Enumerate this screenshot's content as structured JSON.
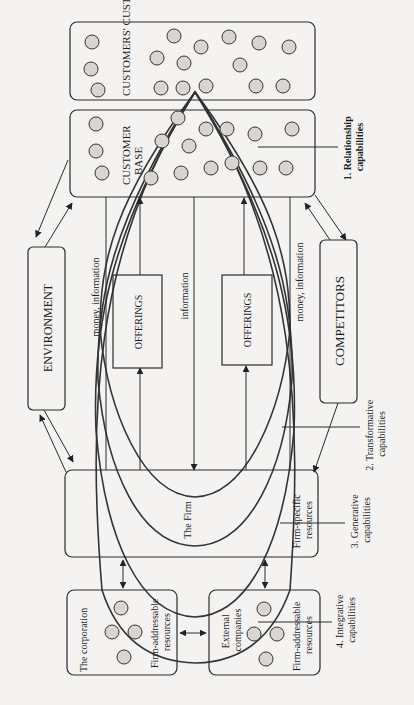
{
  "figure": {
    "orientation": "rotated-90-ccw",
    "boxes": {
      "customers_customers": "CUSTOMERS' CUSTOMERS",
      "customer_base": [
        "CUSTOMER",
        "BASE"
      ],
      "environment": "ENVIRONMENT",
      "competitors": "COMPETITORS",
      "offerings_1": "OFFERINGS",
      "offerings_2": "OFFERINGS",
      "firm_specific": [
        "Firm-specific",
        "resources"
      ],
      "the_firm": "The Firm",
      "corporation": "The corporation",
      "corporation_resources": [
        "Firm-addressable",
        "resources"
      ],
      "external_companies": [
        "External",
        "companies"
      ],
      "external_resources": [
        "Firm-addressable",
        "resources"
      ]
    },
    "flows": {
      "left": "money, information",
      "center": "information",
      "right": "money, information"
    },
    "capabilities": [
      {
        "num": "1.",
        "name": "Relationship",
        "suffix": "capabilities"
      },
      {
        "num": "2.",
        "name": "Transformative",
        "suffix": "capabilities"
      },
      {
        "num": "3.",
        "name": "Generative",
        "suffix": "capabilities"
      },
      {
        "num": "4.",
        "name": "Integrative",
        "suffix": "capabilities"
      }
    ]
  }
}
